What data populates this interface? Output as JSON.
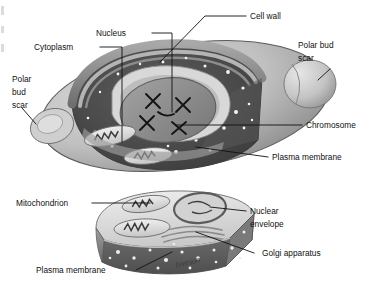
{
  "figure": {
    "signature": "Iverson",
    "colors": {
      "label_text": "#111111",
      "leader_line": "#111111",
      "cell_exterior_light": "#c8c8c8",
      "cell_exterior_mid": "#9a9a9a",
      "cell_interior_dark": "#4a4a4a",
      "cytoplasm_speckle": "#f2f2f2",
      "nucleus_fill": "#8f8f8f",
      "organelle_light": "#e2e2e2",
      "background": "#ffffff"
    }
  },
  "labels": {
    "cell_wall": "Cell wall",
    "nucleus": "Nucleus",
    "cytoplasm": "Cytoplasm",
    "polar_bud_scar_right_line1": "Polar bud",
    "polar_bud_scar_right_line2": "scar",
    "polar_bud_scar_left_line1": "Polar",
    "polar_bud_scar_left_line2": "bud",
    "polar_bud_scar_left_line3": "scar",
    "chromosome": "Chromosome",
    "plasma_membrane_upper": "Plasma membrane",
    "mitochondrion": "Mitochondrion",
    "nuclear_envelope_line1": "Nuclear",
    "nuclear_envelope_line2": "envelope",
    "golgi_apparatus": "Golgi apparatus",
    "plasma_membrane_lower": "Plasma membrane"
  },
  "structures": {
    "upper_cell": "cut-away ovoid yeast cell",
    "lower_cell": "sectioned wedge block of yeast cell"
  }
}
